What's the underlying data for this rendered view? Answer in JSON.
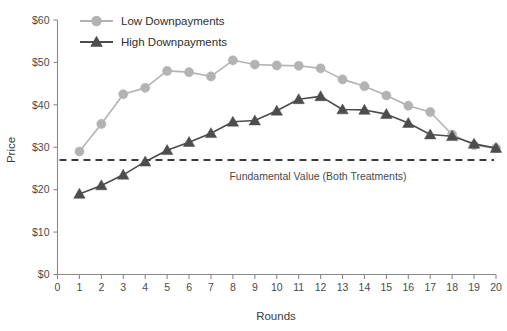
{
  "chart_data": {
    "type": "line",
    "title": "",
    "xlabel": "Rounds",
    "ylabel": "Price",
    "x": [
      1,
      2,
      3,
      4,
      5,
      6,
      7,
      8,
      9,
      10,
      11,
      12,
      13,
      14,
      15,
      16,
      17,
      18,
      19,
      20
    ],
    "xlim": [
      0,
      20
    ],
    "ylim": [
      0,
      60
    ],
    "y_tick_labels": [
      "$0",
      "$10",
      "$20",
      "$30",
      "$40",
      "$50",
      "$60"
    ],
    "y_tick_values": [
      0,
      10,
      20,
      30,
      40,
      50,
      60
    ],
    "x_tick_labels": [
      "0",
      "1",
      "2",
      "3",
      "4",
      "5",
      "6",
      "7",
      "8",
      "9",
      "10",
      "11",
      "12",
      "13",
      "14",
      "15",
      "16",
      "17",
      "18",
      "19",
      "20"
    ],
    "grid": false,
    "legend_position": "top-left",
    "series": [
      {
        "name": "Low Downpayments",
        "marker": "circle",
        "color": "#b3b3b3",
        "values": [
          29.0,
          35.5,
          42.5,
          44.0,
          48.0,
          47.7,
          46.7,
          50.5,
          49.5,
          49.3,
          49.2,
          48.6,
          46.0,
          44.4,
          42.2,
          39.8,
          38.3,
          33.0,
          30.5,
          29.8
        ]
      },
      {
        "name": "High Downpayments",
        "marker": "triangle",
        "color": "#4d4d4d",
        "values": [
          19.0,
          21.0,
          23.5,
          26.6,
          29.3,
          31.2,
          33.3,
          36.0,
          36.3,
          38.6,
          41.3,
          42.0,
          38.9,
          38.8,
          37.8,
          35.7,
          33.0,
          32.6,
          30.8,
          29.8
        ]
      }
    ],
    "annotations": [
      {
        "name": "fundamental-value-line",
        "label": "Fundamental Value (Both Treatments)",
        "value": 27.0,
        "style": "dashed",
        "color": "#3a3a3a"
      }
    ]
  }
}
